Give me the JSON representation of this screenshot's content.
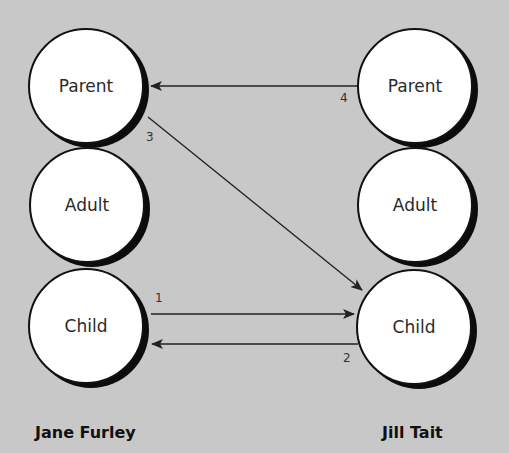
{
  "diagram": {
    "title": "",
    "background": "#c8c8c8",
    "people": [
      {
        "name": "Jane Furley",
        "states": [
          "Parent",
          "Adult",
          "Child"
        ]
      },
      {
        "name": "Jill Tait",
        "states": [
          "Parent",
          "Adult",
          "Child"
        ]
      }
    ],
    "left": {
      "name": "Jane Furley",
      "parent": "Parent",
      "adult": "Adult",
      "child": "Child"
    },
    "right": {
      "name": "Jill Tait",
      "parent": "Parent",
      "adult": "Adult",
      "child": "Child"
    },
    "transactions": [
      {
        "label": "1",
        "from": "Jane Furley: Child",
        "to": "Jill Tait: Child"
      },
      {
        "label": "2",
        "from": "Jill Tait: Child",
        "to": "Jane Furley: Child"
      },
      {
        "label": "3",
        "from": "Jane Furley: Parent",
        "to": "Jill Tait: Child"
      },
      {
        "label": "4",
        "from": "Jill Tait: Parent",
        "to": "Jane Furley: Parent"
      }
    ]
  }
}
